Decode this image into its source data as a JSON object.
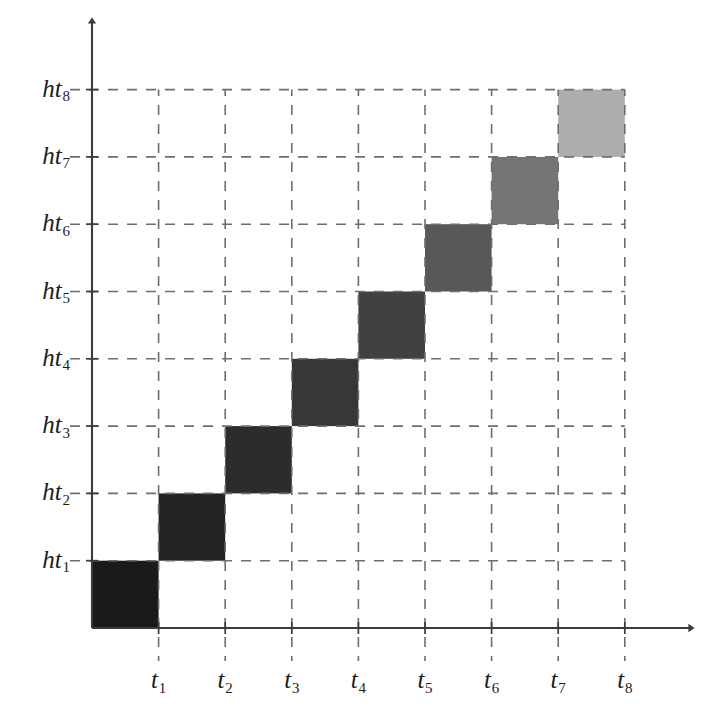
{
  "figure": {
    "kind": "diagonal-block-grid",
    "background_color": "#ffffff",
    "axis_color": "#3b3b3b",
    "grid_color": "#6e6e6e"
  },
  "axes": {
    "x_axis": {
      "name": "time-axis",
      "tick_labels": [
        {
          "base": "t",
          "sub": "1"
        },
        {
          "base": "t",
          "sub": "2"
        },
        {
          "base": "t",
          "sub": "3"
        },
        {
          "base": "t",
          "sub": "4"
        },
        {
          "base": "t",
          "sub": "5"
        },
        {
          "base": "t",
          "sub": "6"
        },
        {
          "base": "t",
          "sub": "7"
        },
        {
          "base": "t",
          "sub": "8"
        }
      ]
    },
    "y_axis": {
      "name": "hidden-state-axis",
      "tick_labels": [
        {
          "base": "ht",
          "sub": "1"
        },
        {
          "base": "ht",
          "sub": "2"
        },
        {
          "base": "ht",
          "sub": "3"
        },
        {
          "base": "ht",
          "sub": "4"
        },
        {
          "base": "ht",
          "sub": "5"
        },
        {
          "base": "ht",
          "sub": "6"
        },
        {
          "base": "ht",
          "sub": "7"
        },
        {
          "base": "ht",
          "sub": "8"
        }
      ]
    }
  },
  "chart_data": {
    "type": "heatmap",
    "title": "",
    "xlabel": "",
    "ylabel": "",
    "x": [
      "t1",
      "t2",
      "t3",
      "t4",
      "t5",
      "t6",
      "t7",
      "t8"
    ],
    "y": [
      "ht1",
      "ht2",
      "ht3",
      "ht4",
      "ht5",
      "ht6",
      "ht7",
      "ht8"
    ],
    "grid": true,
    "grid_style": "dashed",
    "legend": "none",
    "note": "Only the main diagonal cells (t_i, ht_i) are filled; all off-diagonal cells are empty/white. Fill darkness decreases monotonically from ht1 to ht8.",
    "cells": [
      {
        "x": "t1",
        "y": "ht1",
        "value": 1.0,
        "color": "#1a1a1a"
      },
      {
        "x": "t2",
        "y": "ht2",
        "value": 0.88,
        "color": "#232323"
      },
      {
        "x": "t3",
        "y": "ht3",
        "value": 0.78,
        "color": "#2c2c2c"
      },
      {
        "x": "t4",
        "y": "ht4",
        "value": 0.67,
        "color": "#373737"
      },
      {
        "x": "t5",
        "y": "ht5",
        "value": 0.56,
        "color": "#414141"
      },
      {
        "x": "t6",
        "y": "ht6",
        "value": 0.43,
        "color": "#585858"
      },
      {
        "x": "t7",
        "y": "ht7",
        "value": 0.3,
        "color": "#757575"
      },
      {
        "x": "t8",
        "y": "ht8",
        "value": 0.15,
        "color": "#adadad"
      }
    ],
    "values": [
      [
        1.0,
        null,
        null,
        null,
        null,
        null,
        null,
        null
      ],
      [
        null,
        0.88,
        null,
        null,
        null,
        null,
        null,
        null
      ],
      [
        null,
        null,
        0.78,
        null,
        null,
        null,
        null,
        null
      ],
      [
        null,
        null,
        null,
        0.67,
        null,
        null,
        null,
        null
      ],
      [
        null,
        null,
        null,
        null,
        0.56,
        null,
        null,
        null
      ],
      [
        null,
        null,
        null,
        null,
        null,
        0.43,
        null,
        null
      ],
      [
        null,
        null,
        null,
        null,
        null,
        null,
        0.3,
        null
      ],
      [
        null,
        null,
        null,
        null,
        null,
        null,
        null,
        0.15
      ]
    ]
  }
}
